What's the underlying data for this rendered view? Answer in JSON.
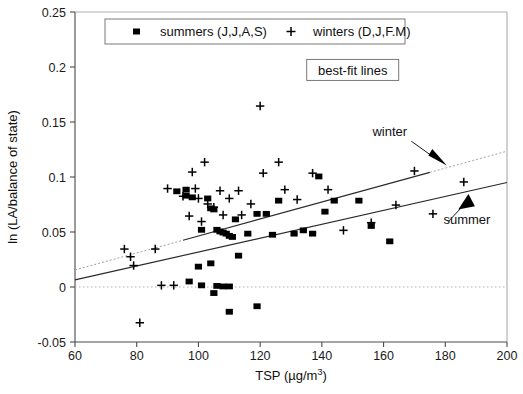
{
  "chart_data": {
    "type": "scatter",
    "title": "",
    "xlabel": "TSP (µg/m3)",
    "xlabel_base": "TSP (µg/m",
    "xlabel_sup": "3",
    "xlabel_tail": ")",
    "ylabel": "ln (LA/balance of state)",
    "xlim": [
      60,
      200
    ],
    "ylim": [
      -0.05,
      0.25
    ],
    "xticks": [
      60,
      80,
      100,
      120,
      140,
      160,
      180,
      200
    ],
    "xticklabels": [
      "60",
      "80",
      "100",
      "120",
      "140",
      "160",
      "180",
      "200"
    ],
    "yticks": [
      -0.05,
      0,
      0.05,
      0.1,
      0.15,
      0.2,
      0.25
    ],
    "yticklabels": [
      "-0.05",
      "0",
      "0.05",
      "0.1",
      "0.15",
      "0.2",
      "0.25"
    ],
    "grid": false,
    "zero_line": {
      "y": 0,
      "style": "dotted",
      "color": "#b0b0b0"
    },
    "legend": {
      "position": "top-center",
      "entries": [
        {
          "label": "summers (J,J,A,S)",
          "marker": "square",
          "color": "#000000"
        },
        {
          "label": "winters (D,J,F.M)",
          "marker": "plus",
          "color": "#000000"
        }
      ]
    },
    "annotations": [
      {
        "text": "best-fit lines",
        "boxed": true,
        "x": 150,
        "y": 0.196
      },
      {
        "text": "winter",
        "boxed": false,
        "x": 162,
        "y": 0.137
      },
      {
        "text": "summer",
        "boxed": false,
        "x": 187,
        "y": 0.057
      }
    ],
    "series": [
      {
        "name": "summers (J,J,A,S)",
        "marker": "square",
        "color": "#000000",
        "points": [
          [
            93,
            0.087
          ],
          [
            96,
            0.083
          ],
          [
            98,
            0.0815
          ],
          [
            101,
            0.052
          ],
          [
            103,
            0.0805
          ],
          [
            104,
            0.0715
          ],
          [
            105,
            0.0705
          ],
          [
            106,
            0.052
          ],
          [
            107,
            0.0505
          ],
          [
            108,
            0.0495
          ],
          [
            109,
            0.0485
          ],
          [
            110,
            0.0465
          ],
          [
            111,
            0.0455
          ],
          [
            104,
            0.0215
          ],
          [
            100,
            0.0185
          ],
          [
            97,
            0.005
          ],
          [
            101,
            0.0015
          ],
          [
            106,
            0.001
          ],
          [
            108,
            0.0005
          ],
          [
            110,
            0.0005
          ],
          [
            105,
            -0.0055
          ],
          [
            110,
            -0.0225
          ],
          [
            119,
            -0.0175
          ],
          [
            113,
            0.0285
          ],
          [
            116,
            0.0485
          ],
          [
            112,
            0.0615
          ],
          [
            119,
            0.0665
          ],
          [
            122,
            0.0665
          ],
          [
            124,
            0.0475
          ],
          [
            126,
            0.0785
          ],
          [
            131,
            0.0485
          ],
          [
            134,
            0.0515
          ],
          [
            137,
            0.0485
          ],
          [
            139,
            0.1005
          ],
          [
            141,
            0.0685
          ],
          [
            144,
            0.0785
          ],
          [
            152,
            0.0785
          ],
          [
            156,
            0.0555
          ],
          [
            162,
            0.0415
          ],
          [
            96,
            0.0885
          ]
        ]
      },
      {
        "name": "winters (D,J,F.M)",
        "marker": "plus",
        "color": "#000000",
        "points": [
          [
            76,
            0.0345
          ],
          [
            78,
            0.0275
          ],
          [
            79,
            0.0195
          ],
          [
            81,
            -0.0325
          ],
          [
            86,
            0.0345
          ],
          [
            88,
            0.0015
          ],
          [
            90,
            0.0895
          ],
          [
            92,
            0.0015
          ],
          [
            95,
            0.0825
          ],
          [
            97,
            0.0645
          ],
          [
            98,
            0.1045
          ],
          [
            100,
            0.0805
          ],
          [
            101,
            0.0595
          ],
          [
            102,
            0.1135
          ],
          [
            103,
            0.0755
          ],
          [
            105,
            0.0725
          ],
          [
            107,
            0.0875
          ],
          [
            108,
            0.0655
          ],
          [
            110,
            0.0805
          ],
          [
            113,
            0.0875
          ],
          [
            114,
            0.0655
          ],
          [
            117,
            0.0755
          ],
          [
            120,
            0.1645
          ],
          [
            121,
            0.1035
          ],
          [
            126,
            0.1135
          ],
          [
            128,
            0.0885
          ],
          [
            132,
            0.0795
          ],
          [
            137,
            0.1035
          ],
          [
            142,
            0.0885
          ],
          [
            147,
            0.0515
          ],
          [
            156,
            0.0585
          ],
          [
            164,
            0.0745
          ],
          [
            170,
            0.1055
          ],
          [
            176,
            0.0665
          ],
          [
            186,
            0.0955
          ],
          [
            99,
            0.0895
          ]
        ]
      }
    ],
    "fit_lines": [
      {
        "name": "winter",
        "x0": 60,
        "y0": 0.0155,
        "x1": 200,
        "y1": 0.1235,
        "style": "dotted-solid"
      },
      {
        "name": "summer",
        "x0": 60,
        "y0": 0.0065,
        "x1": 200,
        "y1": 0.095,
        "style": "solid"
      }
    ]
  }
}
